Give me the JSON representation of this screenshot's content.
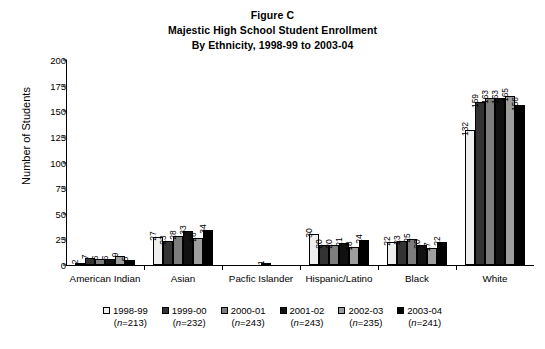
{
  "title_lines": [
    "Figure C",
    "Majestic High School Student Enrollment",
    "By Ethnicity, 1998-99 to 2003-04"
  ],
  "axis": {
    "ylabel": "Number of Students",
    "yticks": [
      "0",
      "25",
      "50",
      "75",
      "100",
      "125",
      "150",
      "175",
      "200"
    ]
  },
  "legend": [
    {
      "label": "1998-99",
      "n": "(n=213)",
      "color": "#eeeeee"
    },
    {
      "label": "1999-00",
      "n": "(n=232)",
      "color": "#333333"
    },
    {
      "label": "2000-01",
      "n": "(n=243)",
      "color": "#7d7d7d"
    },
    {
      "label": "2001-02",
      "n": "(n=243)",
      "color": "#111111"
    },
    {
      "label": "2002-03",
      "n": "(n=235)",
      "color": "#9e9e9e"
    },
    {
      "label": "2003-04",
      "n": "(n=241)",
      "color": "#000000"
    }
  ],
  "chart_data": {
    "type": "bar",
    "xlabel": "",
    "ylabel": "Number of Students",
    "ylim": [
      0,
      200
    ],
    "ytick_step": 25,
    "grid": false,
    "legend_position": "bottom",
    "categories": [
      "American Indian",
      "Asian",
      "Pacfic Islander",
      "Hispanic/Latino",
      "Black",
      "White"
    ],
    "series": [
      {
        "name": "1998-99",
        "n": 213,
        "color": "#eeeeee",
        "values": [
          2,
          27,
          0,
          30,
          22,
          132
        ]
      },
      {
        "name": "1999-00",
        "n": 232,
        "color": "#333333",
        "values": [
          7,
          23,
          0,
          20,
          23,
          159
        ]
      },
      {
        "name": "2000-01",
        "n": 243,
        "color": "#7d7d7d",
        "values": [
          6,
          28,
          0,
          20,
          25,
          163
        ]
      },
      {
        "name": "2001-02",
        "n": 243,
        "color": "#111111",
        "values": [
          6,
          33,
          1,
          21,
          20,
          163
        ]
      },
      {
        "name": "2002-03",
        "n": 235,
        "color": "#9e9e9e",
        "values": [
          9,
          26,
          0,
          18,
          17,
          165
        ]
      },
      {
        "name": "2003-04",
        "n": 241,
        "color": "#000000",
        "values": [
          5,
          34,
          0,
          24,
          22,
          156
        ]
      }
    ]
  }
}
